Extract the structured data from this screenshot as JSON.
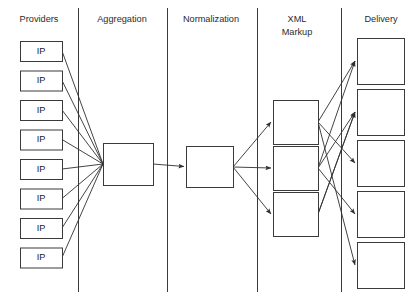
{
  "diagram": {
    "canvas": {
      "width": 419,
      "height": 300,
      "background": "#ffffff"
    },
    "stroke_color": "#3a3a3a",
    "line_color": "#2f2f2f",
    "text_color": "#2b2b2b",
    "columns": [
      {
        "id": "providers",
        "label": "Providers",
        "title_x": 39,
        "title_lines": [
          "Providers"
        ],
        "divider_x": 78
      },
      {
        "id": "aggregation",
        "label": "Aggregation",
        "title_x": 122,
        "title_lines": [
          "Aggregation"
        ],
        "divider_x": 167
      },
      {
        "id": "normalization",
        "label": "Normalization",
        "title_x": 211,
        "title_lines": [
          "Normalization"
        ],
        "divider_x": 257
      },
      {
        "id": "xml-markup",
        "label": "XML Markup",
        "title_x": 297,
        "title_lines": [
          "XML",
          "Markup"
        ],
        "divider_x": 341
      },
      {
        "id": "delivery",
        "label": "Delivery",
        "title_x": 381,
        "title_lines": [
          "Delivery"
        ],
        "divider_x": null
      }
    ],
    "title_baseline_y": 20,
    "title_line_height": 13,
    "nodes": {
      "providers": {
        "label": "IP",
        "count": 8,
        "x": 20,
        "width": 42,
        "height": 20,
        "first_y": 41,
        "pitch": 29.5
      },
      "aggregation": {
        "label": "",
        "count": 1,
        "x": 103,
        "y": 143,
        "width": 50,
        "height": 42
      },
      "normalization": {
        "label": "",
        "count": 1,
        "x": 186,
        "y": 146,
        "width": 47,
        "height": 41
      },
      "xml_markup": {
        "label": "",
        "count": 3,
        "x": 273,
        "width": 45,
        "height": 44,
        "first_y": 100,
        "pitch": 46
      },
      "delivery": {
        "label": "",
        "count": 5,
        "x": 357,
        "width": 47,
        "height": 46,
        "first_y": 38,
        "pitch": 51
      }
    },
    "edges": {
      "providers_to_aggregation": {
        "from": "providers (all 8)",
        "to": "aggregation",
        "arrowheads": false,
        "converge_point": {
          "x": 103,
          "y": 164
        }
      },
      "aggregation_to_normalization": {
        "from": "aggregation",
        "to": "normalization",
        "arrowheads": true
      },
      "normalization_to_xml": {
        "from": "normalization",
        "to": "xml_markup (3)",
        "arrowheads": true,
        "fan_origin": {
          "x": 233,
          "y": 167
        }
      },
      "xml_to_delivery": {
        "from": "xml_markup",
        "to": "delivery",
        "arrowheads": true,
        "pairs": [
          {
            "from_box": 1,
            "to_box": 1
          },
          {
            "from_box": 1,
            "to_box": 3
          },
          {
            "from_box": 1,
            "to_box": 5
          },
          {
            "from_box": 2,
            "to_box": 1
          },
          {
            "from_box": 2,
            "to_box": 2
          },
          {
            "from_box": 2,
            "to_box": 4
          },
          {
            "from_box": 3,
            "to_box": 2
          },
          {
            "from_box": 3,
            "to_box": 2
          }
        ]
      }
    }
  }
}
